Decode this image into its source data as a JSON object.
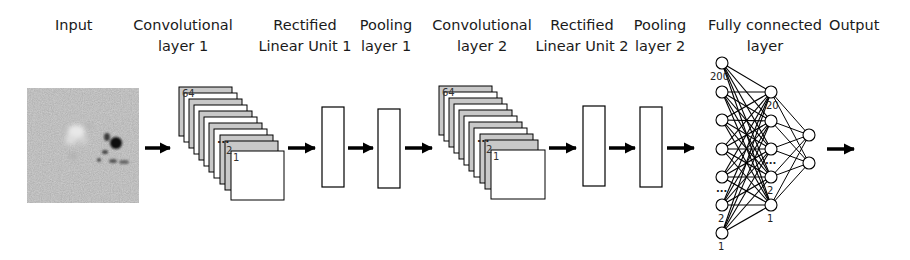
{
  "diagram": {
    "stages": [
      {
        "id": "input",
        "label_line1": "Input",
        "label_line2": ""
      },
      {
        "id": "conv1",
        "label_line1": "Convolutional",
        "label_line2": "layer 1"
      },
      {
        "id": "relu1",
        "label_line1": "Rectified",
        "label_line2": "Linear Unit 1"
      },
      {
        "id": "pool1",
        "label_line1": "Pooling",
        "label_line2": "layer 1"
      },
      {
        "id": "conv2",
        "label_line1": "Convolutional",
        "label_line2": "layer 2"
      },
      {
        "id": "relu2",
        "label_line1": "Rectified",
        "label_line2": "Linear Unit 2"
      },
      {
        "id": "pool2",
        "label_line1": "Pooling",
        "label_line2": "layer 2"
      },
      {
        "id": "fc",
        "label_line1": "Fully connected",
        "label_line2": "layer"
      },
      {
        "id": "output",
        "label_line1": "Output",
        "label_line2": ""
      }
    ],
    "conv1": {
      "top_label": "64",
      "ellipsis": "...",
      "second_label": "2",
      "first_label": "1",
      "card_count": 11
    },
    "conv2": {
      "top_label": "64",
      "ellipsis": "...",
      "second_label": "2",
      "first_label": "1",
      "card_count": 11
    },
    "fc": {
      "input_layer": {
        "top_label": "200",
        "ellipsis": "...",
        "second_label": "2",
        "first_label": "1",
        "node_count_drawn": 7
      },
      "hidden_layer": {
        "top_label": "20",
        "ellipsis": "...",
        "second_label": "2",
        "first_label": "1",
        "node_count_drawn": 5
      },
      "output_layer": {
        "node_count_drawn": 2
      }
    },
    "colors": {
      "line": "#000000",
      "card_gray": "#c8c8c8",
      "card_white": "#ffffff",
      "input_bg": "#8a8a8a"
    }
  }
}
